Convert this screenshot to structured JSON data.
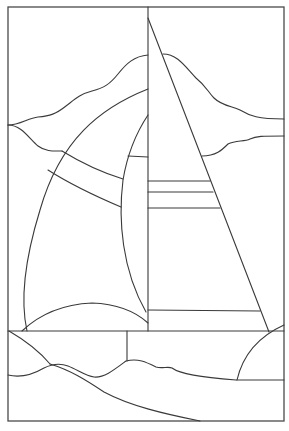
{
  "artwork": {
    "subject": "sailboat stained glass pattern",
    "colors": {
      "background": "#ffffff",
      "line": "#3a3a3a",
      "frame": "#4a4a4a"
    }
  }
}
